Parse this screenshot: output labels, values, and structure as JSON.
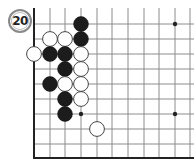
{
  "problem": {
    "number": "20"
  },
  "board": {
    "columns_x": [
      34,
      50,
      65,
      81,
      97,
      112,
      128,
      144,
      159,
      175,
      190
    ],
    "rows_y": [
      24,
      39,
      54,
      69,
      84,
      99,
      114,
      129,
      144,
      158
    ],
    "top_extend_y": 8,
    "left_edge": true,
    "bottom_edge": true,
    "line_color": "#8c8c8c",
    "edge_color": "#222222",
    "star_points": [
      [
        3,
        6
      ],
      [
        9,
        0
      ],
      [
        9,
        6
      ]
    ],
    "stones": [
      {
        "color": "black",
        "col": 3,
        "row": 0
      },
      {
        "color": "white",
        "col": 1,
        "row": 1
      },
      {
        "color": "white",
        "col": 2,
        "row": 1
      },
      {
        "color": "black",
        "col": 3,
        "row": 1
      },
      {
        "color": "white",
        "col": 0,
        "row": 2
      },
      {
        "color": "black",
        "col": 1,
        "row": 2
      },
      {
        "color": "black",
        "col": 2,
        "row": 2
      },
      {
        "color": "white",
        "col": 3,
        "row": 2
      },
      {
        "color": "black",
        "col": 2,
        "row": 3
      },
      {
        "color": "white",
        "col": 3,
        "row": 3
      },
      {
        "color": "black",
        "col": 1,
        "row": 4
      },
      {
        "color": "white",
        "col": 2,
        "row": 4
      },
      {
        "color": "white",
        "col": 3,
        "row": 4
      },
      {
        "color": "black",
        "col": 2,
        "row": 5
      },
      {
        "color": "white",
        "col": 3,
        "row": 5
      },
      {
        "color": "black",
        "col": 2,
        "row": 6
      },
      {
        "color": "white",
        "col": 4,
        "row": 7
      }
    ]
  }
}
